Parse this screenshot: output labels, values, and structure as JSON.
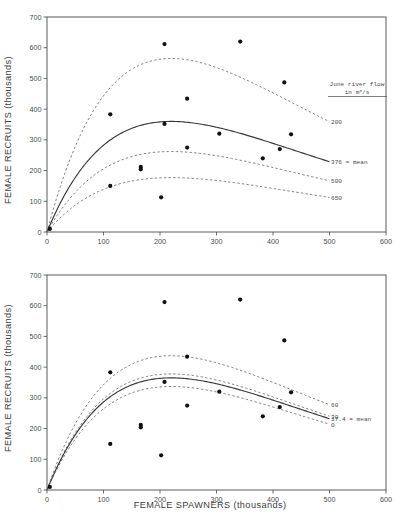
{
  "figure": {
    "xlabel": "FEMALE SPAWNERS (thousands)",
    "ylabel": "FEMALE RECRUITS (thousands)"
  },
  "axes": {
    "x_ticks": [
      "0",
      "100",
      "200",
      "300",
      "400",
      "500",
      "600"
    ],
    "y_ticks": [
      "0",
      "100",
      "200",
      "300",
      "400",
      "500",
      "600",
      "700"
    ]
  },
  "chart_data": [
    {
      "type": "scatter",
      "panel": "top",
      "title": "",
      "xlabel": "FEMALE SPAWNERS (thousands)",
      "ylabel": "FEMALE RECRUITS (thousands)",
      "xlim": [
        0,
        600
      ],
      "ylim": [
        0,
        700
      ],
      "xticks": [
        0,
        100,
        200,
        300,
        400,
        500,
        600
      ],
      "yticks": [
        0,
        100,
        200,
        300,
        400,
        500,
        600,
        700
      ],
      "grid": false,
      "legend_position": "right",
      "legend_title": [
        "June river flow",
        "in m3/s"
      ],
      "points": [
        {
          "x": 5,
          "y": 10
        },
        {
          "x": 112,
          "y": 383
        },
        {
          "x": 112,
          "y": 150
        },
        {
          "x": 166,
          "y": 212
        },
        {
          "x": 166,
          "y": 204
        },
        {
          "x": 202,
          "y": 113
        },
        {
          "x": 208,
          "y": 612
        },
        {
          "x": 208,
          "y": 352
        },
        {
          "x": 248,
          "y": 434
        },
        {
          "x": 248,
          "y": 275
        },
        {
          "x": 305,
          "y": 320
        },
        {
          "x": 342,
          "y": 620
        },
        {
          "x": 382,
          "y": 240
        },
        {
          "x": 412,
          "y": 270
        },
        {
          "x": 420,
          "y": 487
        },
        {
          "x": 432,
          "y": 318
        }
      ],
      "series": [
        {
          "name": "200",
          "label": "200",
          "style": "dashed",
          "alpha": 0.01515,
          "beta": 0.00455,
          "x_end": 500,
          "peak_y": 565
        },
        {
          "name": "376 = mean",
          "label": "376 = mean",
          "style": "solid",
          "alpha": 0.00965,
          "beta": 0.00455,
          "x_end": 500,
          "peak_y": 360
        },
        {
          "name": "500",
          "label": "500",
          "style": "dashed",
          "alpha": 0.00703,
          "beta": 0.00455,
          "x_end": 500,
          "peak_y": 262
        },
        {
          "name": "650",
          "label": "650",
          "style": "dashed",
          "alpha": 0.00475,
          "beta": 0.00455,
          "x_end": 500,
          "peak_y": 177
        }
      ]
    },
    {
      "type": "scatter",
      "panel": "bottom",
      "title": "",
      "xlabel": "FEMALE SPAWNERS (thousands)",
      "ylabel": "FEMALE RECRUITS (thousands)",
      "xlim": [
        0,
        600
      ],
      "ylim": [
        0,
        700
      ],
      "xticks": [
        0,
        100,
        200,
        300,
        400,
        500,
        600
      ],
      "yticks": [
        0,
        100,
        200,
        300,
        400,
        500,
        600,
        700
      ],
      "grid": false,
      "legend_position": "right",
      "legend_title": [
        "Holyoke",
        "lifting rate",
        "(percentage)"
      ],
      "points": [
        {
          "x": 5,
          "y": 10
        },
        {
          "x": 112,
          "y": 383
        },
        {
          "x": 112,
          "y": 150
        },
        {
          "x": 166,
          "y": 212
        },
        {
          "x": 166,
          "y": 204
        },
        {
          "x": 202,
          "y": 113
        },
        {
          "x": 208,
          "y": 612
        },
        {
          "x": 208,
          "y": 352
        },
        {
          "x": 248,
          "y": 434
        },
        {
          "x": 248,
          "y": 275
        },
        {
          "x": 305,
          "y": 320
        },
        {
          "x": 342,
          "y": 620
        },
        {
          "x": 382,
          "y": 240
        },
        {
          "x": 412,
          "y": 270
        },
        {
          "x": 420,
          "y": 487
        },
        {
          "x": 432,
          "y": 318
        }
      ],
      "series": [
        {
          "name": "60",
          "label": "60",
          "style": "dashed",
          "alpha": 0.01188,
          "beta": 0.00455,
          "x_end": 500,
          "peak_y": 437
        },
        {
          "name": "30",
          "label": "30",
          "style": "dashed",
          "alpha": 0.01027,
          "beta": 0.00455,
          "x_end": 500,
          "peak_y": 378
        },
        {
          "name": "17.4 = mean",
          "label": "17.4 = mean",
          "style": "solid",
          "alpha": 0.00992,
          "beta": 0.00455,
          "x_end": 500,
          "peak_y": 365
        },
        {
          "name": "0",
          "label": "0",
          "style": "dashed",
          "alpha": 0.00916,
          "beta": 0.00455,
          "x_end": 500,
          "peak_y": 337
        }
      ]
    }
  ]
}
